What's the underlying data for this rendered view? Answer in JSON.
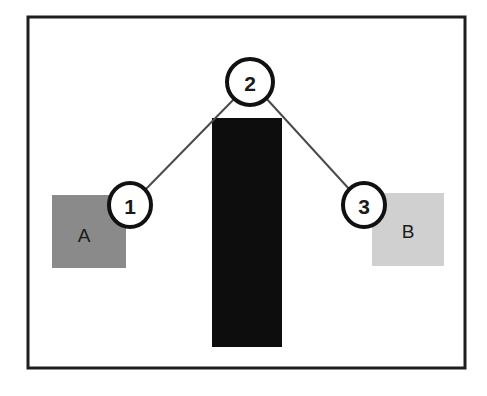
{
  "figure": {
    "background_color": "#ffffff",
    "frame": {
      "name": "outer-frame",
      "x": 28,
      "y": 17,
      "width": 437,
      "height": 351,
      "stroke_color": "#1e1e1e",
      "stroke_width": 3,
      "fill_color": "#ffffff"
    },
    "regions": [
      {
        "id": "region-a",
        "label": "A",
        "fill_color": "#8a8a8a",
        "x": 52,
        "y": 195,
        "width": 74,
        "height": 73,
        "label_x": 84,
        "label_y": 235
      },
      {
        "id": "region-b",
        "label": "B",
        "fill_color": "#d0d0d0",
        "x": 372,
        "y": 193,
        "width": 72,
        "height": 73,
        "label_x": 408,
        "label_y": 231
      }
    ],
    "obstacle": {
      "id": "center-block",
      "fill_color": "#0d0d0d",
      "x": 212,
      "y": 118,
      "width": 70,
      "height": 229
    },
    "edges": [
      {
        "id": "edge-1-2",
        "from": "node-1",
        "to": "node-2",
        "x1": 146,
        "y1": 189,
        "x2": 236,
        "y2": 97,
        "stroke_color": "#4a4a4a",
        "stroke_width": 2
      },
      {
        "id": "edge-2-3",
        "from": "node-2",
        "to": "node-3",
        "x1": 265,
        "y1": 97,
        "x2": 350,
        "y2": 190,
        "stroke_color": "#4a4a4a",
        "stroke_width": 2
      }
    ],
    "nodes": [
      {
        "id": "node-1",
        "label": "1",
        "cx": 130,
        "cy": 205,
        "rx": 21,
        "ry": 22,
        "fill_color": "#ffffff",
        "stroke_color": "#111111",
        "stroke_width": 4
      },
      {
        "id": "node-2",
        "label": "2",
        "cx": 250,
        "cy": 82,
        "rx": 23,
        "ry": 23,
        "fill_color": "#ffffff",
        "stroke_color": "#111111",
        "stroke_width": 4
      },
      {
        "id": "node-3",
        "label": "3",
        "cx": 364,
        "cy": 205,
        "rx": 21,
        "ry": 22,
        "fill_color": "#ffffff",
        "stroke_color": "#111111",
        "stroke_width": 4
      }
    ]
  }
}
